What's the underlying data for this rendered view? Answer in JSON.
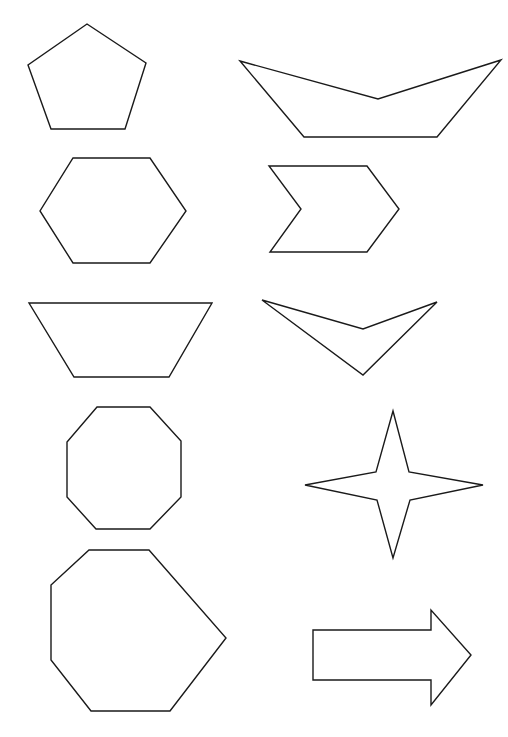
{
  "canvas": {
    "width": 508,
    "height": 737,
    "background": "#ffffff",
    "stroke": "#1a1a1a"
  },
  "shapes": [
    {
      "name": "pentagon",
      "points": "87,24 146,63 125,129 51,129 28,65"
    },
    {
      "name": "hexagon",
      "points": "73,158 150,158 186,211 150,263 73,263 40,211"
    },
    {
      "name": "trapezoid",
      "points": "29,303 212,303 169,377 74,377"
    },
    {
      "name": "octagon",
      "points": "97,407 150,407 181,441 181,497 150,529 96,529 67,497 67,442"
    },
    {
      "name": "heptagon",
      "points": "89,550 149,550 226,638 170,711 91,711 51,660 51,585"
    },
    {
      "name": "boat-shape",
      "points": "240,61 378,99 501,60 437,137 304,137"
    },
    {
      "name": "chevron",
      "points": "269,166 367,166 399,209 367,252 270,252 301,209"
    },
    {
      "name": "v-shape",
      "points": "262,300 363,329 437,302 363,375"
    },
    {
      "name": "four-point-star",
      "points": "393,411 409,472 483,485 410,500 393,558 377,500 305,485 376,472"
    },
    {
      "name": "right-arrow",
      "points": "313,630 431,630 431,610 471,655 431,705 431,680 313,680"
    }
  ]
}
